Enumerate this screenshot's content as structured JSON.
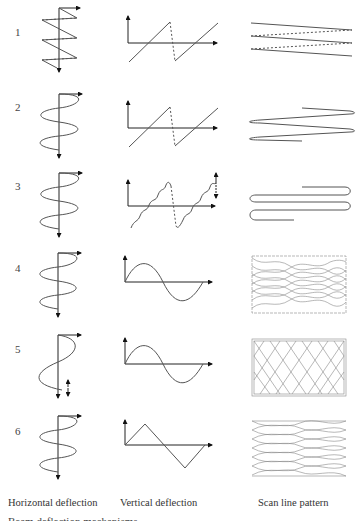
{
  "figure": {
    "rows": [
      {
        "number": "1"
      },
      {
        "number": "2"
      },
      {
        "number": "3"
      },
      {
        "number": "4"
      },
      {
        "number": "5"
      },
      {
        "number": "6"
      }
    ],
    "columns": {
      "horizontal": "Horizontal deflection",
      "vertical": "Vertical deflection",
      "scan": "Scan line pattern"
    },
    "truncated_caption": "Beam deflection mechanisms"
  }
}
